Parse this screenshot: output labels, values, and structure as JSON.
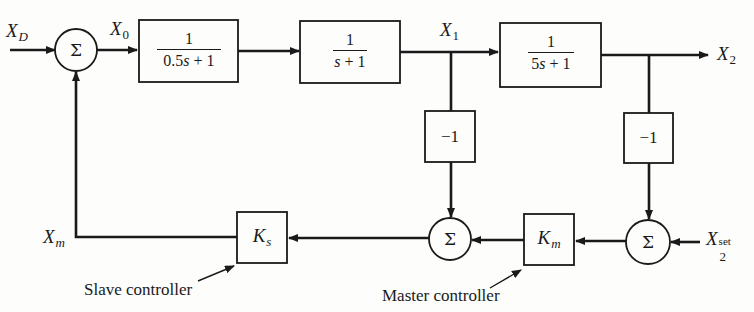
{
  "diagram": {
    "type": "cascade-control-block-diagram",
    "signals": {
      "input_disturbance": {
        "base": "X",
        "sub": "D"
      },
      "x0": {
        "base": "X",
        "sub": "0"
      },
      "x1": {
        "base": "X",
        "sub": "1"
      },
      "x2": {
        "base": "X",
        "sub": "2"
      },
      "xm": {
        "base": "X",
        "sub": "m"
      },
      "x2set": {
        "base": "X",
        "sub": "2",
        "sup": "set"
      }
    },
    "blocks": {
      "g1": {
        "num": "1",
        "den_pre": "0.5",
        "den_var": "s",
        "den_post": " + 1"
      },
      "g2": {
        "num": "1",
        "den_pre": "",
        "den_var": "s",
        "den_post": " + 1"
      },
      "g3": {
        "num": "1",
        "den_pre": "5",
        "den_var": "s",
        "den_post": " + 1"
      },
      "neg1": {
        "label": "−1"
      },
      "neg2": {
        "label": "−1"
      },
      "ks": {
        "base": "K",
        "sub": "s"
      },
      "km": {
        "base": "K",
        "sub": "m"
      }
    },
    "summing_junctions": {
      "sum1": {
        "symbol": "Σ"
      },
      "sum2": {
        "symbol": "Σ"
      },
      "sum3": {
        "symbol": "Σ"
      }
    },
    "annotations": {
      "slave": "Slave controller",
      "master": "Master controller"
    }
  }
}
